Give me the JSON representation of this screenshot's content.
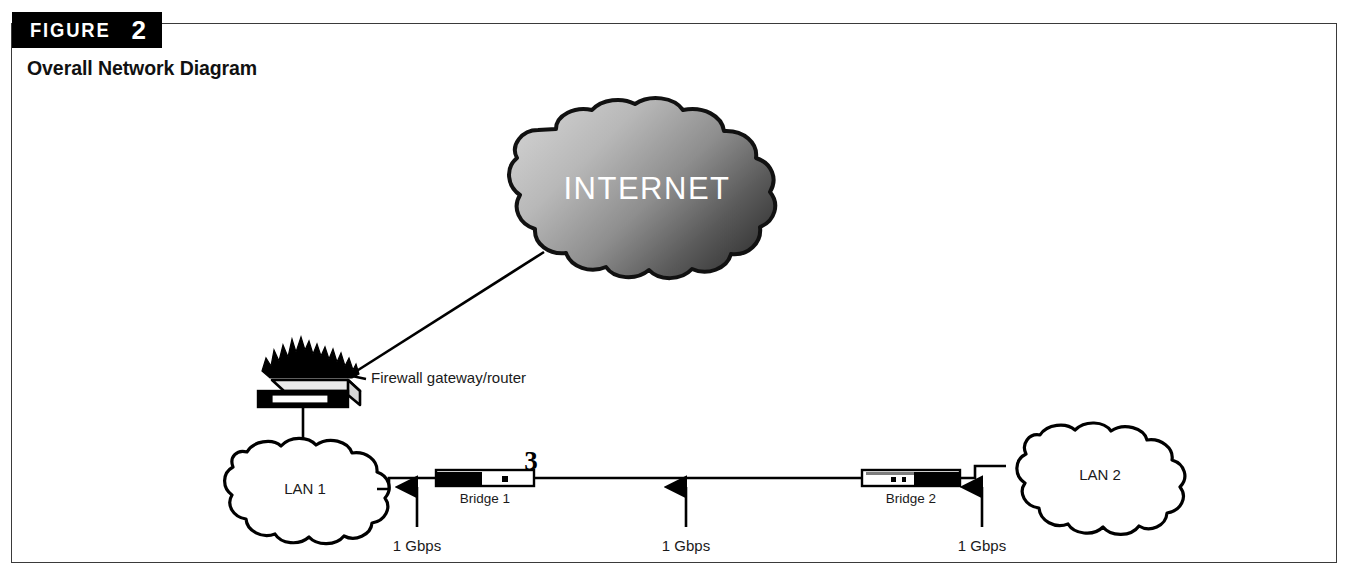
{
  "figure": {
    "banner_word": "FIGURE",
    "banner_number": "2",
    "subtitle": "Overall Network Diagram"
  },
  "colors": {
    "border": "#3a3a3a",
    "banner_bg": "#000000",
    "banner_fg": "#ffffff",
    "ink": "#000000",
    "cloud_internet_light": "#c9c9c9",
    "cloud_internet_dark": "#3d3d3d",
    "cloud_lan_fill": "#ffffff",
    "internet_text": "#ffffff"
  },
  "diagram": {
    "type": "network-topology",
    "nodes": [
      {
        "id": "internet",
        "kind": "cloud-shaded",
        "label": "INTERNET"
      },
      {
        "id": "firewall",
        "kind": "firewall-appliance",
        "label": "Firewall gateway/router"
      },
      {
        "id": "lan1",
        "kind": "cloud-outline",
        "label": "LAN 1"
      },
      {
        "id": "bridge1",
        "kind": "bridge",
        "label": "Bridge 1"
      },
      {
        "id": "bridge2",
        "kind": "bridge",
        "label": "Bridge 2"
      },
      {
        "id": "lan2",
        "kind": "cloud-outline",
        "label": "LAN 2"
      }
    ],
    "annotations": [
      {
        "id": "port-3",
        "label": "3",
        "attached_to": "bridge1"
      }
    ],
    "links": [
      {
        "from": "internet",
        "to": "firewall",
        "style": "diagonal",
        "label": ""
      },
      {
        "from": "firewall",
        "to": "lan1",
        "style": "vertical",
        "label": ""
      },
      {
        "from": "lan1",
        "to": "bridge1",
        "style": "stepped",
        "label": "1 Gbps"
      },
      {
        "from": "bridge1",
        "to": "bridge2",
        "style": "horizontal",
        "label": "1 Gbps"
      },
      {
        "from": "bridge2",
        "to": "lan2",
        "style": "stepped",
        "label": "1 Gbps"
      }
    ],
    "link_labels": [
      {
        "id": "gbps-left",
        "text": "1 Gbps"
      },
      {
        "id": "gbps-middle",
        "text": "1 Gbps"
      },
      {
        "id": "gbps-right",
        "text": "1 Gbps"
      }
    ]
  }
}
